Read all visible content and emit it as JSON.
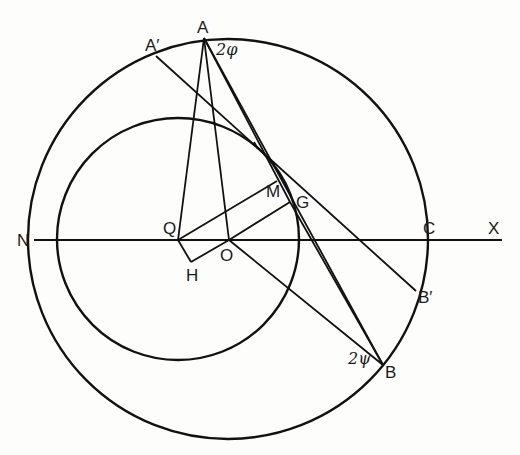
{
  "diagram": {
    "type": "geometry-construction",
    "colors": {
      "ink": "#111111",
      "paper": "#fdfdfc"
    },
    "circles": {
      "outer": {
        "name": "outer-circle",
        "cx": 228,
        "cy": 239,
        "r": 200
      },
      "inner": {
        "name": "inner-circle",
        "cx": 178,
        "cy": 239,
        "r": 121
      }
    },
    "points": {
      "A": {
        "x": 204,
        "y": 38
      },
      "A_prime": {
        "x": 156,
        "y": 56
      },
      "B": {
        "x": 383,
        "y": 365
      },
      "B_prime": {
        "x": 416,
        "y": 291
      },
      "C": {
        "x": 420,
        "y": 240
      },
      "N": {
        "x": 34,
        "y": 240
      },
      "X": {
        "x": 502,
        "y": 240
      },
      "Q": {
        "x": 178,
        "y": 240
      },
      "H": {
        "x": 191,
        "y": 262
      },
      "O": {
        "x": 229,
        "y": 240
      },
      "M": {
        "x": 277,
        "y": 181
      },
      "G": {
        "x": 290,
        "y": 202
      }
    },
    "labels": {
      "A": "A",
      "A_prime": "A′",
      "two_phi": "2φ",
      "M": "M",
      "G": "G",
      "Q": "Q",
      "O": "O",
      "H": "H",
      "N": "N",
      "C": "C",
      "X": "X",
      "B_prime": "B′",
      "two_psi": "2ψ",
      "B": "B"
    }
  }
}
